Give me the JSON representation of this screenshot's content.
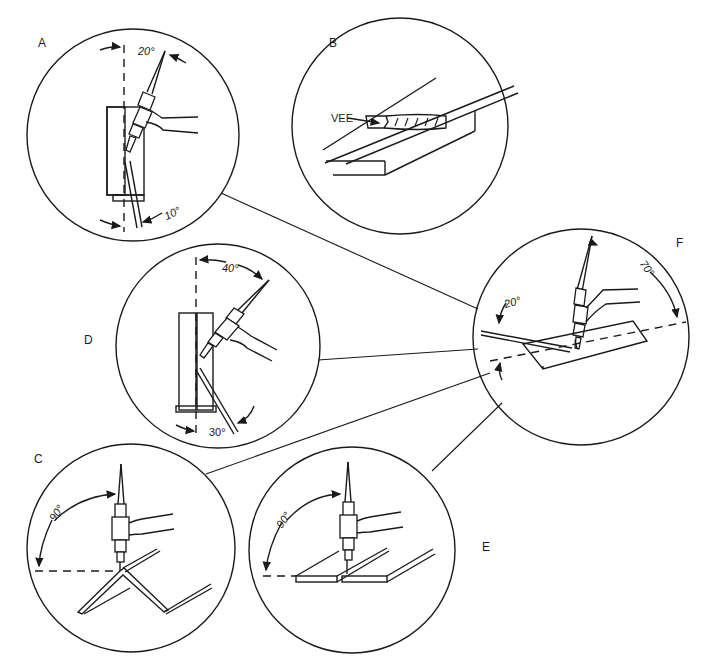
{
  "panels": {
    "A": {
      "label": "A",
      "torch_angle": "20°",
      "rod_angle": "10°"
    },
    "B": {
      "label": "B",
      "callout": "VEE"
    },
    "C": {
      "label": "C",
      "torch_angle": "90°"
    },
    "D": {
      "label": "D",
      "torch_angle": "40°",
      "rod_angle": "30°"
    },
    "E": {
      "label": "E",
      "torch_angle": "90°"
    },
    "F": {
      "label": "F",
      "torch_angle": "70°",
      "rod_angle": "20°"
    }
  }
}
